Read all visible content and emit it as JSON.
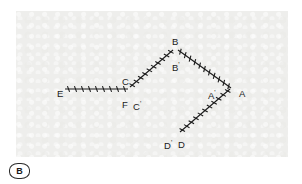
{
  "figure": {
    "caption_label": "B",
    "panel": {
      "background_color": "#eeeeec",
      "x": 16,
      "y": 11,
      "width": 272,
      "height": 146
    },
    "line_color": "#1b1b1b",
    "label_color": "#1b1b1b"
  },
  "vertices": [
    {
      "id": "E",
      "label": "E",
      "prime": "",
      "x": 57,
      "y": 89
    },
    {
      "id": "C",
      "label": "C",
      "prime": "",
      "x": 122,
      "y": 77
    },
    {
      "id": "F",
      "label": "F",
      "prime": "",
      "x": 122,
      "y": 100
    },
    {
      "id": "Cp",
      "label": "C",
      "prime": "'",
      "x": 133,
      "y": 100
    },
    {
      "id": "B",
      "label": "B",
      "prime": "",
      "x": 172,
      "y": 37
    },
    {
      "id": "Bp",
      "label": "B",
      "prime": "'",
      "x": 172,
      "y": 61
    },
    {
      "id": "Ap",
      "label": "A",
      "prime": "'",
      "x": 208,
      "y": 89
    },
    {
      "id": "A",
      "label": "A",
      "prime": "",
      "x": 239,
      "y": 89
    },
    {
      "id": "Dp",
      "label": "D",
      "prime": "'",
      "x": 164,
      "y": 139
    },
    {
      "id": "D",
      "label": "D",
      "prime": "",
      "x": 178,
      "y": 140
    }
  ],
  "segments": [
    {
      "name": "segment-E-F",
      "from": "E",
      "to": "F",
      "x1": 49,
      "y1": 78,
      "x2": 112,
      "y2": 78,
      "ticks": 9
    },
    {
      "name": "segment-C-B",
      "from": "C",
      "to": "B",
      "x1": 114,
      "y1": 76,
      "x2": 157,
      "y2": 39,
      "ticks": 10
    },
    {
      "name": "segment-B-A",
      "from": "B",
      "to": "A",
      "x1": 162,
      "y1": 39,
      "x2": 215,
      "y2": 77,
      "ticks": 11
    },
    {
      "name": "segment-A-D",
      "from": "A",
      "to": "D",
      "x1": 214,
      "y1": 78,
      "x2": 164,
      "y2": 121,
      "ticks": 11
    }
  ],
  "chart_data": {
    "type": "diagram",
    "stations": [
      "E",
      "F",
      "C",
      "C'",
      "B",
      "B'",
      "A'",
      "A",
      "D'",
      "D"
    ],
    "connections": [
      {
        "from": "E",
        "to": "F",
        "style": "hatched",
        "ticks": 9
      },
      {
        "from": "C",
        "to": "B",
        "style": "hatched",
        "ticks": 10
      },
      {
        "from": "B",
        "to": "A",
        "style": "hatched",
        "ticks": 11
      },
      {
        "from": "A",
        "to": "D",
        "style": "hatched",
        "ticks": 11
      }
    ]
  }
}
